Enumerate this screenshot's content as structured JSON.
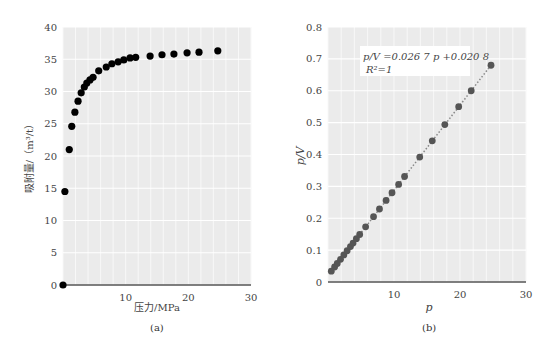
{
  "chart_data": [
    {
      "type": "scatter",
      "panel": "(a)",
      "title": "",
      "xlabel": "压力/MPa",
      "ylabel": "吸附量/（m³/t）",
      "xlim": [
        0,
        30
      ],
      "ylim": [
        0,
        40
      ],
      "xticks": [
        10,
        20,
        30
      ],
      "yticks": [
        0,
        5,
        10,
        15,
        20,
        25,
        30,
        35,
        40
      ],
      "grid": true,
      "marker_color": "#000000",
      "x": [
        0,
        0.3,
        1.0,
        1.4,
        1.9,
        2.4,
        2.9,
        3.4,
        3.8,
        4.3,
        4.8,
        5.7,
        6.9,
        7.8,
        8.8,
        9.7,
        10.7,
        11.6,
        13.9,
        15.8,
        17.7,
        19.8,
        21.7,
        24.7
      ],
      "y": [
        0,
        14.5,
        21.0,
        24.6,
        26.8,
        28.5,
        29.8,
        30.7,
        31.3,
        31.8,
        32.2,
        33.2,
        33.8,
        34.3,
        34.6,
        34.9,
        35.2,
        35.3,
        35.5,
        35.7,
        35.8,
        36.0,
        36.1,
        36.3
      ]
    },
    {
      "type": "scatter",
      "panel": "(b)",
      "title": "",
      "xlabel": "p",
      "ylabel": "p/V",
      "xlim": [
        0,
        30
      ],
      "ylim": [
        0,
        0.8
      ],
      "xticks": [
        10,
        20,
        30
      ],
      "yticks": [
        0,
        0.1,
        0.2,
        0.3,
        0.4,
        0.5,
        0.6,
        0.7,
        0.8
      ],
      "grid": true,
      "marker_color": "#555555",
      "fit_line": {
        "slope": 0.0267,
        "intercept": 0.0208,
        "style": "dotted",
        "color": "#888888"
      },
      "annotation": [
        "p/V = 0.026 7 p + 0.020 8",
        "R² = 1"
      ],
      "x": [
        0.5,
        1.0,
        1.4,
        1.9,
        2.4,
        2.9,
        3.4,
        3.8,
        4.3,
        4.8,
        5.7,
        6.9,
        7.8,
        8.8,
        9.7,
        10.7,
        11.6,
        13.9,
        15.8,
        17.7,
        19.8,
        21.7,
        24.7
      ],
      "y": [
        0.034,
        0.047,
        0.058,
        0.071,
        0.085,
        0.098,
        0.111,
        0.122,
        0.136,
        0.149,
        0.173,
        0.205,
        0.229,
        0.256,
        0.28,
        0.306,
        0.331,
        0.392,
        0.443,
        0.494,
        0.55,
        0.6,
        0.68
      ]
    }
  ],
  "captions": {
    "a": "(a)",
    "b": "(b)"
  },
  "labels": {
    "a_xlabel": "压力/MPa",
    "a_ylabel": "吸附量/（m³/t）",
    "b_xlabel": "p",
    "b_ylabel": "p/V",
    "b_eq": "p/V =0.026 7 p +0.020 8",
    "b_r2": "R²=1"
  }
}
